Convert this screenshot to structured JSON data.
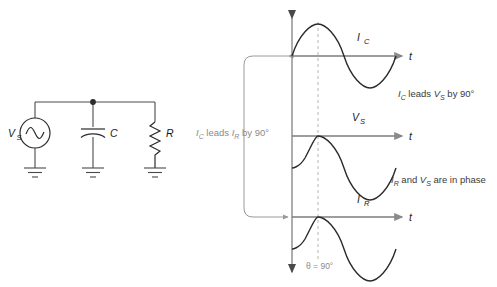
{
  "figure": {
    "circuit": {
      "source_label": "V",
      "source_sub": "S",
      "source_name": "ac-voltage-source",
      "capacitor_label": "C",
      "resistor_label": "R",
      "ground_count": 3
    },
    "waveforms": [
      {
        "label": "I",
        "sub": "C",
        "axis_label": "t",
        "phase_deg": 0,
        "description": "capacitor current leads by 90 degrees"
      },
      {
        "label": "V",
        "sub": "S",
        "axis_label": "t",
        "phase_deg": -90,
        "description": "source voltage reference"
      },
      {
        "label": "I",
        "sub": "R",
        "axis_label": "t",
        "phase_deg": -90,
        "description": "resistor current in phase with source voltage"
      }
    ],
    "annotations": {
      "left_bracket": {
        "prefix": "I",
        "sub1": "C",
        "middle": " leads ",
        "sub2_base": "I",
        "sub2": "R",
        "suffix": " by 90°",
        "full": "IC leads IR by 90°"
      },
      "right_top": {
        "base1": "I",
        "sub1": "C",
        "middle": " leads ",
        "base2": "V",
        "sub2": "S",
        "suffix": " by 90°",
        "full": "IC leads VS by 90°"
      },
      "right_bottom": {
        "base1": "I",
        "sub1": "R",
        "middle": " and ",
        "base2": "V",
        "sub2": "S",
        "suffix": " are in phase",
        "full": "IR and VS are in phase"
      },
      "theta": "θ = 90°"
    },
    "colors": {
      "wave": "#2b2b2b",
      "axis": "#8a8a8a",
      "wire": "#4a4a4a",
      "dashed": "#b5b5b5",
      "note": "#3a3a3a",
      "note_gray": "#8a8a8a",
      "background": "#ffffff"
    }
  }
}
